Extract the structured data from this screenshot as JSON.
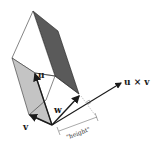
{
  "diagram": {
    "colors": {
      "dark_face": "#5a5a5a",
      "light_face": "#c4c4c4",
      "stroke": "#222222",
      "background": "#ffffff"
    },
    "labels": {
      "u": "u",
      "v": "v",
      "w": "w",
      "cross": "u × v",
      "height": "\"height\""
    },
    "vectors": [
      {
        "name": "u",
        "from": [
          52,
          125
        ],
        "to": [
          35,
          73
        ]
      },
      {
        "name": "v",
        "from": [
          52,
          125
        ],
        "to": [
          29,
          115
        ]
      },
      {
        "name": "w",
        "from": [
          52,
          125
        ],
        "to": [
          80,
          95
        ]
      },
      {
        "name": "u × v",
        "from": [
          52,
          125
        ],
        "to": [
          123,
          82
        ]
      }
    ]
  }
}
